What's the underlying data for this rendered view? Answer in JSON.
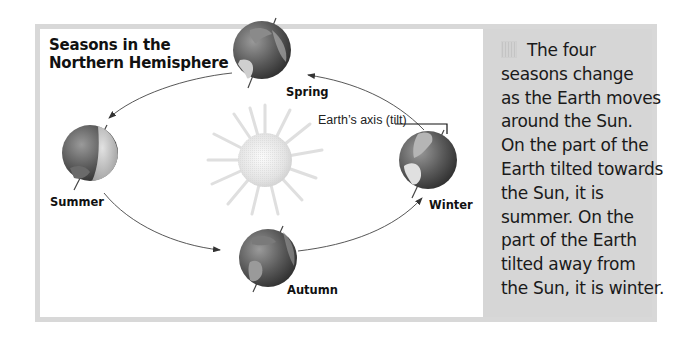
{
  "diagram": {
    "title_lines": [
      "Seasons in the",
      "Northern Hemisphere"
    ],
    "seasons": [
      {
        "name": "Spring",
        "label": "Spring"
      },
      {
        "name": "Summer",
        "label": "Summer"
      },
      {
        "name": "Autumn",
        "label": "Autumn"
      },
      {
        "name": "Winter",
        "label": "Winter"
      }
    ],
    "axis_label": "Earth’s axis (tilt)",
    "center_object": "Sun",
    "orbit_direction": "counter-clockwise (Spring → Summer → Autumn → Winter → Spring)"
  },
  "panel": {
    "bullet_icon": "hatched-square-icon",
    "lines": [
      "The four",
      "seasons change",
      "as the Earth moves",
      "around the Sun.",
      "On the part of the",
      "Earth tilted towards",
      "the Sun, it is",
      "summer. On the",
      "part of the Earth",
      "tilted away from",
      "the Sun, it is winter."
    ]
  },
  "colors": {
    "frame": "#d8d8d8",
    "panel_bg": "#d6d6d6",
    "diagram_bg": "#ffffff",
    "globe_dark": "#3a3a3a",
    "globe_light": "#bdbdbd",
    "sun": "#e6e6e6",
    "text": "#111111"
  }
}
